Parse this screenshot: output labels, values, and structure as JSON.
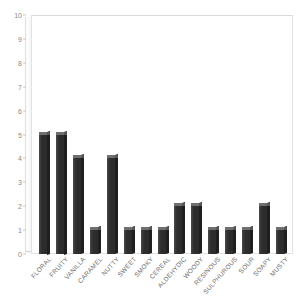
{
  "chart_data": {
    "type": "bar",
    "title": "",
    "subtitle": "",
    "xlabel": "",
    "ylabel": "",
    "ylim": [
      0,
      10
    ],
    "grid": false,
    "legend": "none",
    "y_ticks": [
      "0",
      "1",
      "2",
      "3",
      "4",
      "5",
      "6",
      "7",
      "8",
      "9",
      "10"
    ],
    "categories": [
      "FLORAL",
      "FRUITY",
      "VANILLA",
      "CARAMEL",
      "NUTTY",
      "SWEET",
      "SMOKY",
      "CEREAL",
      "ALDEHYDIC",
      "WOODY",
      "RESINOUS",
      "SULPHUROUS",
      "SOUR",
      "SOAPY",
      "MUSTY"
    ],
    "values": [
      5,
      5,
      4,
      1,
      4,
      1,
      1,
      1,
      2,
      2,
      1,
      1,
      1,
      2,
      1
    ],
    "bar_color": "#333333",
    "axis_color": "#8a8a8a",
    "plot_border_color": "#e2e2e2"
  }
}
